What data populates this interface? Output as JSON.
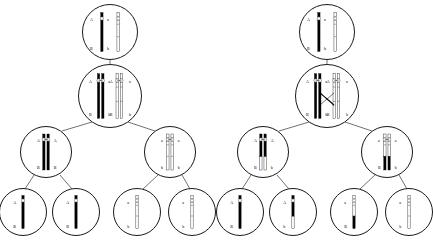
{
  "figure": {
    "type": "biology-diagram",
    "alleles": {
      "a_dom": "A",
      "a_rec": "a",
      "b_dom": "B",
      "b_rec": "b"
    },
    "colors": {
      "dark_chromatid": "#000000",
      "light_chromatid": "#ffffff",
      "outline": "#1a1a1a",
      "background": "#ffffff"
    }
  },
  "panels": [
    {
      "id": "left",
      "name": "no-crossing-over",
      "crossing_over": false,
      "levels": [
        {
          "name": "parent-cell",
          "cells": [
            {
              "id": "L0",
              "cx": 110,
              "cy": 32,
              "r": 28,
              "chromosomes": [
                {
                  "shade": "dark",
                  "replicated": false,
                  "top_label": "A",
                  "bottom_label": "B"
                },
                {
                  "shade": "light",
                  "replicated": false,
                  "top_label": "a",
                  "bottom_label": "b"
                }
              ]
            }
          ]
        },
        {
          "name": "replicated-cell",
          "cells": [
            {
              "id": "L1",
              "cx": 110,
              "cy": 96,
              "r": 32,
              "chromosomes": [
                {
                  "shade": "dark",
                  "replicated": true,
                  "top_label": "A",
                  "top_label2": "A",
                  "bottom_label": "B",
                  "bottom_label2": "B"
                },
                {
                  "shade": "light",
                  "replicated": true,
                  "top_label": "a",
                  "top_label2": "a",
                  "bottom_label": "b",
                  "bottom_label2": "b"
                }
              ]
            }
          ]
        },
        {
          "name": "secondary-cells",
          "cells": [
            {
              "id": "L2a",
              "cx": 46,
              "cy": 152,
              "r": 26,
              "chromosomes": [
                {
                  "shade": "dark",
                  "replicated": true,
                  "top_label": "A",
                  "top_label2": "A",
                  "bottom_label": "B",
                  "bottom_label2": "B"
                }
              ]
            },
            {
              "id": "L2b",
              "cx": 170,
              "cy": 152,
              "r": 26,
              "chromosomes": [
                {
                  "shade": "light",
                  "replicated": true,
                  "top_label": "a",
                  "top_label2": "a",
                  "bottom_label": "b",
                  "bottom_label2": "b"
                }
              ]
            }
          ]
        },
        {
          "name": "gametes",
          "cells": [
            {
              "id": "L3a",
              "cx": 23,
              "cy": 212,
              "r": 24,
              "genotype": "AB",
              "chromosomes": [
                {
                  "shade": "dark",
                  "replicated": false,
                  "top_label": "A",
                  "bottom_label": "B"
                }
              ]
            },
            {
              "id": "L3b",
              "cx": 76,
              "cy": 212,
              "r": 24,
              "genotype": "AB",
              "chromosomes": [
                {
                  "shade": "dark",
                  "replicated": false,
                  "top_label": "A",
                  "bottom_label": "B"
                }
              ]
            },
            {
              "id": "L3c",
              "cx": 137,
              "cy": 212,
              "r": 24,
              "genotype": "ab",
              "chromosomes": [
                {
                  "shade": "light",
                  "replicated": false,
                  "top_label": "a",
                  "bottom_label": "b"
                }
              ]
            },
            {
              "id": "L3d",
              "cx": 192,
              "cy": 212,
              "r": 24,
              "genotype": "ab",
              "chromosomes": [
                {
                  "shade": "light",
                  "replicated": false,
                  "top_label": "a",
                  "bottom_label": "b"
                }
              ]
            }
          ]
        }
      ],
      "edges": [
        {
          "x1": 110,
          "y1": 60,
          "x2": 110,
          "y2": 64
        },
        {
          "x1": 92,
          "y1": 122,
          "x2": 62,
          "y2": 131
        },
        {
          "x1": 128,
          "y1": 122,
          "x2": 155,
          "y2": 131
        },
        {
          "x1": 34,
          "y1": 175,
          "x2": 25,
          "y2": 189
        },
        {
          "x1": 60,
          "y1": 175,
          "x2": 72,
          "y2": 189
        },
        {
          "x1": 158,
          "y1": 175,
          "x2": 143,
          "y2": 189
        },
        {
          "x1": 182,
          "y1": 175,
          "x2": 190,
          "y2": 189
        }
      ]
    },
    {
      "id": "right",
      "name": "with-crossing-over",
      "crossing_over": true,
      "levels": [
        {
          "name": "parent-cell",
          "cells": [
            {
              "id": "R0",
              "cx": 110,
              "cy": 32,
              "r": 28,
              "chromosomes": [
                {
                  "shade": "dark",
                  "replicated": false,
                  "top_label": "A",
                  "bottom_label": "B"
                },
                {
                  "shade": "light",
                  "replicated": false,
                  "top_label": "a",
                  "bottom_label": "b"
                }
              ]
            }
          ]
        },
        {
          "name": "replicated-cell-chiasma",
          "cells": [
            {
              "id": "R1",
              "cx": 110,
              "cy": 96,
              "r": 32,
              "chiasma": true,
              "chromosomes": [
                {
                  "shade": "dark",
                  "replicated": true,
                  "top_label": "A",
                  "top_label2": "A",
                  "bottom_label": "B",
                  "bottom_label2": "B"
                },
                {
                  "shade": "light",
                  "replicated": true,
                  "top_label": "a",
                  "top_label2": "a",
                  "bottom_label": "b",
                  "bottom_label2": "b"
                }
              ]
            }
          ]
        },
        {
          "name": "secondary-cells",
          "cells": [
            {
              "id": "R2a",
              "cx": 46,
              "cy": 152,
              "r": 26,
              "chromosomes": [
                {
                  "shade": "dark",
                  "replicated": true,
                  "recombinant": true,
                  "top_label": "A",
                  "top_label2": "A",
                  "bottom_label": "B",
                  "bottom_label2": "b"
                }
              ]
            },
            {
              "id": "R2b",
              "cx": 170,
              "cy": 152,
              "r": 26,
              "chromosomes": [
                {
                  "shade": "light",
                  "replicated": true,
                  "recombinant": true,
                  "top_label": "a",
                  "top_label2": "a",
                  "bottom_label": "B",
                  "bottom_label2": "b"
                }
              ]
            }
          ]
        },
        {
          "name": "gametes",
          "cells": [
            {
              "id": "R3a",
              "cx": 23,
              "cy": 212,
              "r": 24,
              "genotype": "AB",
              "chromosomes": [
                {
                  "shade": "dark",
                  "replicated": false,
                  "top_label": "A",
                  "bottom_label": "B"
                }
              ]
            },
            {
              "id": "R3b",
              "cx": 76,
              "cy": 212,
              "r": 24,
              "genotype": "Ab",
              "chromosomes": [
                {
                  "shade": "split-dark-top",
                  "replicated": false,
                  "top_label": "A",
                  "bottom_label": "b"
                }
              ]
            },
            {
              "id": "R3c",
              "cx": 137,
              "cy": 212,
              "r": 24,
              "genotype": "aB",
              "chromosomes": [
                {
                  "shade": "split-light-top",
                  "replicated": false,
                  "top_label": "a",
                  "bottom_label": "B"
                }
              ]
            },
            {
              "id": "R3d",
              "cx": 192,
              "cy": 212,
              "r": 24,
              "genotype": "ab",
              "chromosomes": [
                {
                  "shade": "light",
                  "replicated": false,
                  "top_label": "a",
                  "bottom_label": "b"
                }
              ]
            }
          ]
        }
      ],
      "edges": [
        {
          "x1": 110,
          "y1": 60,
          "x2": 110,
          "y2": 64
        },
        {
          "x1": 92,
          "y1": 122,
          "x2": 62,
          "y2": 131
        },
        {
          "x1": 128,
          "y1": 122,
          "x2": 155,
          "y2": 131
        },
        {
          "x1": 34,
          "y1": 175,
          "x2": 25,
          "y2": 189
        },
        {
          "x1": 60,
          "y1": 175,
          "x2": 72,
          "y2": 189
        },
        {
          "x1": 158,
          "y1": 175,
          "x2": 143,
          "y2": 189
        },
        {
          "x1": 182,
          "y1": 175,
          "x2": 190,
          "y2": 189
        }
      ]
    }
  ]
}
